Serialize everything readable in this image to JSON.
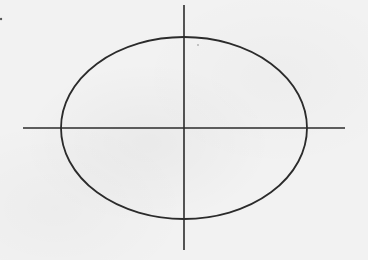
{
  "diagram": {
    "type": "ellipse-on-axes",
    "canvas": {
      "width": 368,
      "height": 260
    },
    "colors": {
      "background": "#f2f2f2",
      "stroke": "#2b2b2b"
    },
    "ellipse": {
      "cx": 184,
      "cy": 128,
      "rx": 123,
      "ry": 91,
      "stroke_width": 1.8
    },
    "x_axis": {
      "x1": 23,
      "y1": 128,
      "x2": 345,
      "y2": 128,
      "stroke_width": 1.6
    },
    "y_axis": {
      "x1": 184,
      "y1": 5,
      "x2": 184,
      "y2": 250,
      "stroke_width": 1.6
    },
    "speck": {
      "cx": 198,
      "cy": 45,
      "r": 0.8
    },
    "corner_mark": {
      "cx": 1,
      "cy": 19,
      "r": 1.2
    }
  }
}
